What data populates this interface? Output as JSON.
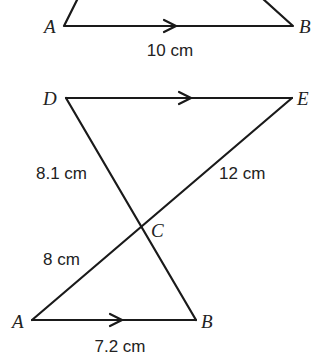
{
  "diagram": {
    "top_figure": {
      "vertices": {
        "A": {
          "label": "A",
          "x": 64,
          "y": 26
        },
        "B": {
          "label": "B",
          "x": 293,
          "y": 26
        }
      },
      "edges": [
        {
          "from": "A",
          "to": "B",
          "parallel_arrow": true,
          "label": "10 cm"
        }
      ]
    },
    "bottom_figure": {
      "vertices": {
        "D": {
          "label": "D",
          "x": 66,
          "y": 98
        },
        "E": {
          "label": "E",
          "x": 292,
          "y": 98
        },
        "C": {
          "label": "C",
          "x": 141,
          "y": 227
        },
        "A": {
          "label": "A",
          "x": 32,
          "y": 320
        },
        "B": {
          "label": "B",
          "x": 196,
          "y": 320
        }
      },
      "edges": [
        {
          "from": "D",
          "to": "E",
          "parallel_arrow": true,
          "label": ""
        },
        {
          "from": "D",
          "to": "C",
          "label": "8.1 cm"
        },
        {
          "from": "E",
          "to": "C",
          "label": "12 cm"
        },
        {
          "from": "A",
          "to": "C",
          "label": "8 cm"
        },
        {
          "from": "C",
          "to": "B",
          "label": ""
        },
        {
          "from": "A",
          "to": "B",
          "parallel_arrow": true,
          "label": "7.2 cm"
        }
      ]
    },
    "labels": {
      "top_A": "A",
      "top_B": "B",
      "top_AB_length": "10 cm",
      "D": "D",
      "E": "E",
      "C": "C",
      "bottom_A": "A",
      "bottom_B": "B",
      "DC_length": "8.1 cm",
      "EC_length": "12 cm",
      "AC_length": "8 cm",
      "AB_length": "7.2 cm"
    }
  }
}
